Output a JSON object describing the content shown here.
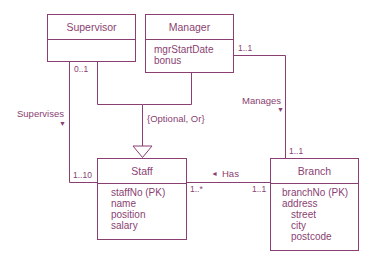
{
  "diagram": {
    "type": "UML class diagram",
    "colors": {
      "line": "#8a3f72",
      "background": "#ffffff"
    },
    "classes": {
      "supervisor": {
        "name": "Supervisor",
        "attributes": []
      },
      "manager": {
        "name": "Manager",
        "attributes": [
          "mgrStartDate",
          "bonus"
        ]
      },
      "staff": {
        "name": "Staff",
        "attributes": [
          "staffNo (PK)",
          "name",
          "position",
          "salary"
        ]
      },
      "branch": {
        "name": "Branch",
        "attributes": [
          "branchNo (PK)",
          "address",
          "street",
          "city",
          "postcode"
        ]
      }
    },
    "relationships": {
      "supervises": {
        "label": "Supervises",
        "arrow": "▼",
        "mult_supervisor": "0..1",
        "mult_staff": "1..10"
      },
      "manages": {
        "label": "Manages",
        "arrow": "▼",
        "mult_manager": "1..1",
        "mult_branch": "1..1"
      },
      "has": {
        "label": "Has",
        "arrow": "◄",
        "mult_staff": "1..*",
        "mult_branch": "1..1"
      },
      "generalization": {
        "constraint": "{Optional, Or}"
      }
    }
  }
}
